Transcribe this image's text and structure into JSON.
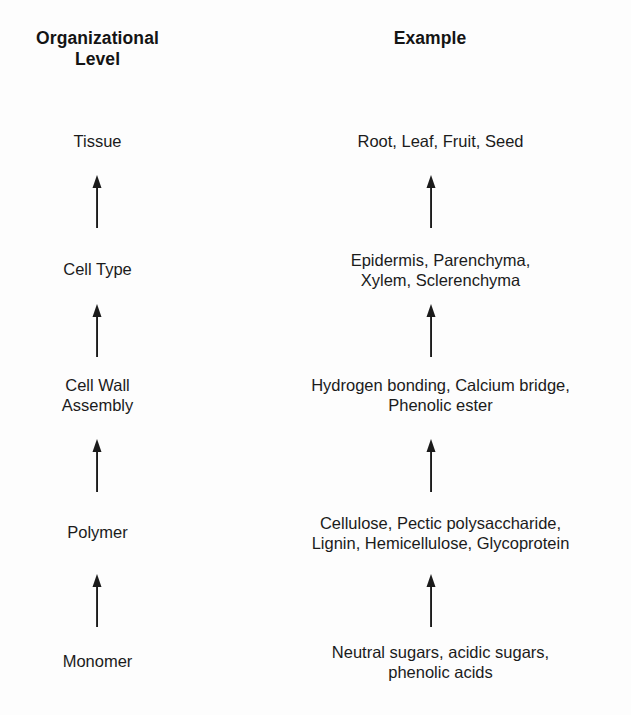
{
  "diagram": {
    "type": "hierarchy-flow",
    "direction": "bottom-to-top",
    "colors": {
      "background": "#fdfdfd",
      "text": "#1b1b1b",
      "header_text": "#141414",
      "arrow": "#1b1b1b"
    },
    "columns": [
      {
        "key": "level",
        "header": "Organizational\nLevel"
      },
      {
        "key": "example",
        "header": "Example"
      }
    ],
    "rows": [
      {
        "level": "Tissue",
        "example": "Root, Leaf, Fruit, Seed"
      },
      {
        "level": "Cell Type",
        "example": "Epidermis, Parenchyma,\nXylem, Sclerenchyma"
      },
      {
        "level": "Cell Wall\nAssembly",
        "example": "Hydrogen bonding, Calcium bridge,\nPhenolic ester"
      },
      {
        "level": "Polymer",
        "example": "Cellulose, Pectic polysaccharide,\nLignin, Hemicellulose, Glycoprotein"
      },
      {
        "level": "Monomer",
        "example": "Neutral sugars, acidic sugars,\nphenolic acids"
      }
    ],
    "arrows": [
      {
        "from": "Cell Type",
        "to": "Tissue",
        "glyph": "arrow-up-icon"
      },
      {
        "from": "Cell Wall Assembly",
        "to": "Cell Type",
        "glyph": "arrow-up-icon"
      },
      {
        "from": "Polymer",
        "to": "Cell Wall Assembly",
        "glyph": "arrow-up-icon"
      },
      {
        "from": "Monomer",
        "to": "Polymer",
        "glyph": "arrow-up-icon"
      }
    ]
  }
}
